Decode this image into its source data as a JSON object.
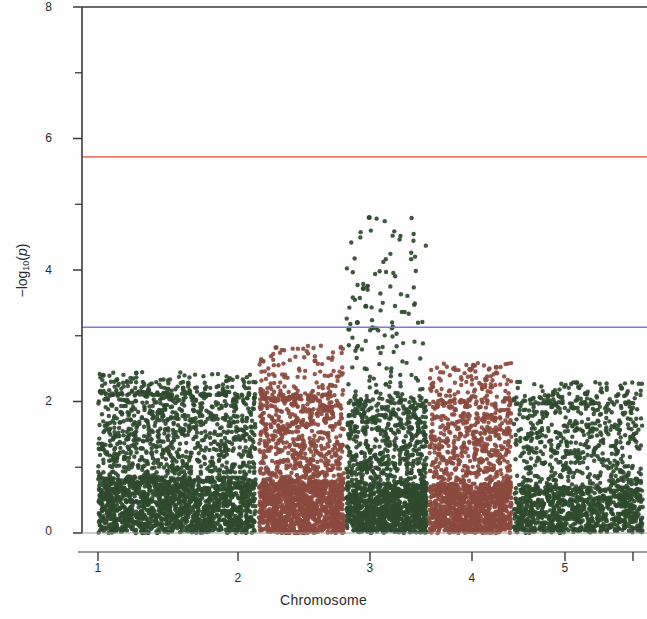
{
  "figure": {
    "type": "manhattan-plot",
    "background_color": "#fefefe"
  },
  "axes": {
    "x_title": "Chromosome",
    "y_title_prefix": "−log",
    "y_title_sub": "10",
    "y_title_open": "(",
    "y_title_var": "p",
    "y_title_close": ")",
    "y_ticks_major": [
      "0",
      "2",
      "4",
      "6",
      "8"
    ],
    "x_ticks": [
      "1",
      "2",
      "3",
      "4",
      "5"
    ]
  },
  "chart_data": {
    "type": "scatter",
    "title": "",
    "subtitle": "",
    "xlabel": "Chromosome",
    "ylabel": "-log10(p)",
    "xlim": [
      0,
      6.6
    ],
    "ylim": [
      0,
      8
    ],
    "y_ticks": [
      0,
      2,
      4,
      6,
      8
    ],
    "y_minor_ticks": [
      1,
      3,
      5,
      7
    ],
    "x_ticks": [
      1,
      2,
      3,
      4,
      5
    ],
    "x_tick_labels": [
      "1",
      "2",
      "3",
      "4",
      "5"
    ],
    "grid": false,
    "legend": null,
    "point_size_px": 2.2,
    "annotations": [
      {
        "name": "genome-wide-significance-line",
        "kind": "hline",
        "y": 5.72,
        "color": "#f4756b",
        "width_px": 1.6
      },
      {
        "name": "suggestive-significance-line",
        "kind": "hline",
        "y": 3.13,
        "color": "#7a7ad6",
        "width_px": 1.6
      }
    ],
    "series": [
      {
        "name": "Chromosome 1",
        "color": "#2f4a2e",
        "x_range": [
          0.12,
          1.98
        ],
        "n_points": 2600,
        "dense_below": 0.85,
        "max_y": 2.45
      },
      {
        "name": "Chromosome 2",
        "color": "#8c4a3e",
        "x_range": [
          2.02,
          3.02
        ],
        "n_points": 1800,
        "dense_below": 0.8,
        "max_y": 2.85
      },
      {
        "name": "Chromosome 3",
        "color": "#2f4a2e",
        "x_range": [
          3.05,
          4.0
        ],
        "n_points": 1700,
        "dense_below": 0.78,
        "max_y": 4.8,
        "peak": {
          "x": 3.32,
          "y": 4.8
        }
      },
      {
        "name": "Chromosome 4",
        "color": "#8c4a3e",
        "x_range": [
          4.03,
          5.0
        ],
        "n_points": 1600,
        "dense_below": 0.75,
        "max_y": 2.6
      },
      {
        "name": "Chromosome 5",
        "color": "#2f4a2e",
        "x_range": [
          5.03,
          6.55
        ],
        "n_points": 1500,
        "dense_below": 0.72,
        "max_y": 2.3
      }
    ],
    "notable_points": [
      {
        "x": 3.32,
        "y": 4.8,
        "series": "Chromosome 3"
      },
      {
        "x": 3.25,
        "y": 3.72,
        "series": "Chromosome 3"
      },
      {
        "x": 3.28,
        "y": 3.45,
        "series": "Chromosome 3"
      },
      {
        "x": 3.18,
        "y": 3.2,
        "series": "Chromosome 3"
      },
      {
        "x": 3.36,
        "y": 3.12,
        "series": "Chromosome 3"
      },
      {
        "x": 3.08,
        "y": 3.1,
        "series": "Chromosome 3"
      },
      {
        "x": 2.22,
        "y": 2.82,
        "series": "Chromosome 2"
      },
      {
        "x": 2.68,
        "y": 2.62,
        "series": "Chromosome 2"
      },
      {
        "x": 4.55,
        "y": 2.55,
        "series": "Chromosome 4"
      },
      {
        "x": 4.82,
        "y": 2.52,
        "series": "Chromosome 4"
      },
      {
        "x": 0.18,
        "y": 2.4,
        "series": "Chromosome 1"
      },
      {
        "x": 4.12,
        "y": 1.92,
        "series": "Chromosome 4"
      },
      {
        "x": 6.3,
        "y": 2.2,
        "series": "Chromosome 5"
      }
    ]
  },
  "geometry": {
    "plot_left_px": 82,
    "plot_right_px": 647,
    "plot_top_px": 7,
    "plot_bottom_px": 533,
    "x_axis_line_y_px": 552,
    "data_start_px": 88
  }
}
